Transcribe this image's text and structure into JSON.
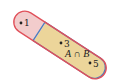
{
  "diagram": {
    "type": "venn",
    "sets": [
      {
        "name": "A",
        "color": "#e0505a",
        "fill_only": "#f2cccc"
      },
      {
        "name": "B",
        "color": "#4a7fc0"
      }
    ],
    "intersection_fill": "#ecd59a",
    "intersection_label": "A ∩ B",
    "elements": [
      {
        "label": "1",
        "region": "A only"
      },
      {
        "label": "3",
        "region": "A ∩ B"
      },
      {
        "label": "5",
        "region": "A ∩ B"
      }
    ]
  }
}
